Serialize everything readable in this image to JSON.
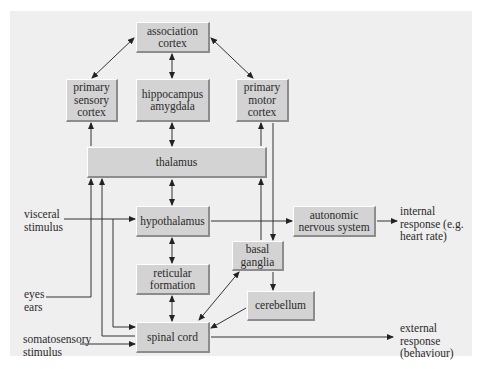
{
  "diagram": {
    "nodes": {
      "association_cortex": "association\ncortex",
      "primary_sensory_cortex": "primary\nsensory\ncortex",
      "hippocampus_amygdala": "hippocampus\namygdala",
      "primary_motor_cortex": "primary\nmotor\ncortex",
      "thalamus": "thalamus",
      "hypothalamus": "hypothalamus",
      "autonomic_nervous_system": "autonomic\nnervous system",
      "reticular_formation": "reticular\nformation",
      "basal_ganglia": "basal\nganglia",
      "cerebellum": "cerebellum",
      "spinal_cord": "spinal cord"
    },
    "inputs": {
      "visceral_stimulus": "visceral\nstimulus",
      "eyes_ears": "eyes\nears",
      "somatosensory_stimulus": "somatosensory\nstimulus"
    },
    "outputs": {
      "internal_response": "internal\nresponse (e.g.\nheart rate)",
      "external_response": "external\nresponse\n(behaviour)"
    },
    "colors": {
      "panel_bg": "#efefef",
      "box_fill": "#d3d3d3",
      "line": "#333333"
    }
  }
}
